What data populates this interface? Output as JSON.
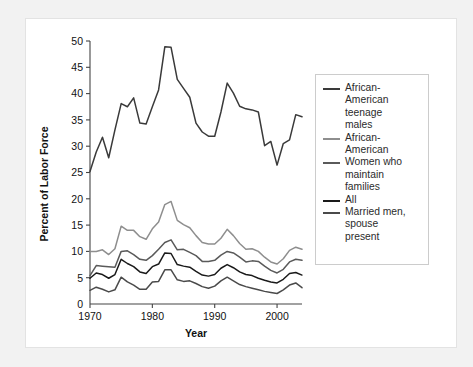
{
  "figure": {
    "background_color": "#f2f2f2",
    "card_color": "#ffffff"
  },
  "legend": {
    "items": [
      {
        "label": "African-\nAmerican\nteenage\nmales",
        "color": "#3a3a3a",
        "swatch_name": "legend-swatch-african-american-teenage-males"
      },
      {
        "label": "African-\nAmerican",
        "color": "#8e8e8e",
        "swatch_name": "legend-swatch-african-american"
      },
      {
        "label": "Women who\nmaintain\nfamilies",
        "color": "#5a5a5a",
        "swatch_name": "legend-swatch-women-who-maintain-families"
      },
      {
        "label": "All",
        "color": "#1a1a1a",
        "swatch_name": "legend-swatch-all"
      },
      {
        "label": "Married men,\nspouse\npresent",
        "color": "#4a4a4a",
        "swatch_name": "legend-swatch-married-men-spouse-present"
      }
    ]
  },
  "chart_data": {
    "type": "line",
    "title": "",
    "xlabel": "Year",
    "ylabel": "Percent of Labor Force",
    "xlim": [
      1970,
      2004
    ],
    "ylim": [
      0,
      50
    ],
    "xticks": [
      1970,
      1980,
      1990,
      2000
    ],
    "xtick_labels": [
      "1970",
      "1980",
      "1990",
      "2000"
    ],
    "yticks": [
      0,
      5,
      10,
      15,
      20,
      25,
      30,
      35,
      40,
      45,
      50
    ],
    "ytick_labels": [
      "0",
      "5",
      "10",
      "15",
      "20",
      "25",
      "30",
      "35",
      "40",
      "45",
      "50"
    ],
    "grid": false,
    "legend_position": "right",
    "x": [
      1970,
      1971,
      1972,
      1973,
      1974,
      1975,
      1976,
      1977,
      1978,
      1979,
      1980,
      1981,
      1982,
      1983,
      1984,
      1985,
      1986,
      1987,
      1988,
      1989,
      1990,
      1991,
      1992,
      1993,
      1994,
      1995,
      1996,
      1997,
      1998,
      1999,
      2000,
      2001,
      2002,
      2003,
      2004
    ],
    "series": [
      {
        "name": "African-American teenage males",
        "color": "#3a3a3a",
        "values": [
          25.2,
          28.9,
          31.7,
          27.8,
          33.1,
          38.1,
          37.5,
          39.2,
          34.4,
          34.2,
          37.5,
          40.7,
          48.9,
          48.8,
          42.7,
          41.0,
          39.3,
          34.4,
          32.7,
          31.9,
          31.9,
          36.5,
          42.0,
          40.1,
          37.6,
          37.1,
          36.9,
          36.5,
          30.1,
          30.9,
          26.4,
          30.5,
          31.2,
          36.0,
          35.6
        ]
      },
      {
        "name": "African-American",
        "color": "#8e8e8e",
        "values": [
          10.0,
          10.0,
          10.3,
          9.4,
          10.5,
          14.8,
          14.0,
          14.0,
          12.8,
          12.3,
          14.3,
          15.6,
          18.9,
          19.5,
          15.9,
          15.1,
          14.5,
          13.0,
          11.7,
          11.4,
          11.4,
          12.5,
          14.2,
          13.0,
          11.5,
          10.4,
          10.5,
          10.0,
          8.9,
          8.0,
          7.6,
          8.6,
          10.2,
          10.8,
          10.4
        ]
      },
      {
        "name": "Women who maintain families",
        "color": "#5a5a5a",
        "values": [
          5.4,
          7.3,
          7.2,
          7.1,
          7.0,
          10.0,
          10.1,
          9.4,
          8.5,
          8.3,
          9.2,
          10.4,
          11.7,
          12.2,
          10.3,
          10.4,
          9.8,
          9.2,
          8.1,
          8.1,
          8.3,
          9.3,
          10.0,
          9.7,
          8.9,
          8.0,
          8.2,
          8.1,
          7.2,
          6.4,
          5.9,
          6.6,
          8.0,
          8.5,
          8.3
        ]
      },
      {
        "name": "All",
        "color": "#1a1a1a",
        "values": [
          4.9,
          5.9,
          5.6,
          4.9,
          5.6,
          8.5,
          7.7,
          7.1,
          6.1,
          5.8,
          7.1,
          7.6,
          9.7,
          9.6,
          7.5,
          7.2,
          7.0,
          6.2,
          5.5,
          5.3,
          5.6,
          6.8,
          7.5,
          6.9,
          6.1,
          5.6,
          5.4,
          4.9,
          4.5,
          4.2,
          4.0,
          4.7,
          5.8,
          6.0,
          5.5
        ]
      },
      {
        "name": "Married men, spouse present",
        "color": "#4a4a4a",
        "values": [
          2.6,
          3.2,
          2.8,
          2.3,
          2.7,
          5.1,
          4.2,
          3.6,
          2.8,
          2.8,
          4.2,
          4.3,
          6.5,
          6.5,
          4.6,
          4.3,
          4.4,
          3.9,
          3.3,
          3.0,
          3.4,
          4.4,
          5.1,
          4.4,
          3.7,
          3.3,
          3.0,
          2.7,
          2.4,
          2.2,
          2.0,
          2.7,
          3.6,
          4.0,
          3.1
        ]
      }
    ]
  }
}
